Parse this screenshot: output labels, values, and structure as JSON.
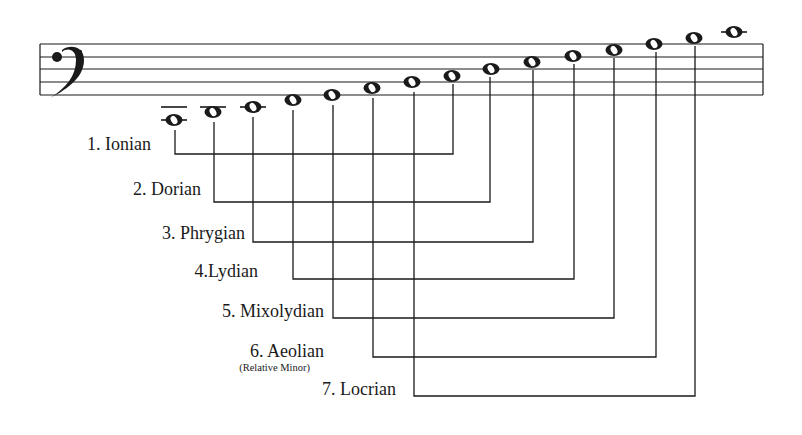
{
  "clef": "bass-clef",
  "colors": {
    "ink": "#1a1a1a",
    "background": "#ffffff"
  },
  "staff": {
    "x_start": 40,
    "x_end": 763,
    "line_y": [
      44,
      57,
      69,
      82,
      95
    ]
  },
  "notes": [
    {
      "index": 1,
      "x": 174,
      "y": 120,
      "ledger": [
        107,
        120
      ]
    },
    {
      "index": 2,
      "x": 213,
      "y": 112,
      "ledger": [
        107
      ]
    },
    {
      "index": 3,
      "x": 253,
      "y": 107,
      "ledger": [
        107
      ]
    },
    {
      "index": 4,
      "x": 293,
      "y": 100,
      "ledger": []
    },
    {
      "index": 5,
      "x": 332,
      "y": 95,
      "ledger": []
    },
    {
      "index": 6,
      "x": 372,
      "y": 88,
      "ledger": []
    },
    {
      "index": 7,
      "x": 412,
      "y": 82,
      "ledger": []
    },
    {
      "index": 8,
      "x": 452,
      "y": 76,
      "ledger": []
    },
    {
      "index": 9,
      "x": 491,
      "y": 69,
      "ledger": []
    },
    {
      "index": 10,
      "x": 532,
      "y": 62,
      "ledger": []
    },
    {
      "index": 11,
      "x": 573,
      "y": 56,
      "ledger": []
    },
    {
      "index": 12,
      "x": 614,
      "y": 50,
      "ledger": []
    },
    {
      "index": 13,
      "x": 654,
      "y": 44,
      "ledger": []
    },
    {
      "index": 14,
      "x": 694,
      "y": 38,
      "ledger": []
    },
    {
      "index": 15,
      "x": 734,
      "y": 32,
      "ledger": [
        32
      ]
    }
  ],
  "modes": [
    {
      "label": "1. Ionian",
      "left_x": 175,
      "right_x": 453,
      "bracket_y": 154,
      "label_right": 151,
      "label_y": 145
    },
    {
      "label": "2. Dorian",
      "left_x": 214,
      "right_x": 490,
      "bracket_y": 202,
      "label_right": 201,
      "label_y": 190
    },
    {
      "label": "3. Phrygian",
      "left_x": 253,
      "right_x": 533,
      "bracket_y": 242,
      "label_right": 245,
      "label_y": 234
    },
    {
      "label": "4.Lydian",
      "left_x": 293,
      "right_x": 574,
      "bracket_y": 279,
      "label_right": 258,
      "label_y": 272
    },
    {
      "label": "5. Mixolydian",
      "left_x": 333,
      "right_x": 614,
      "bracket_y": 318,
      "label_right": 324,
      "label_y": 312,
      "sublabel": null
    },
    {
      "label": "6. Aeolian",
      "left_x": 373,
      "right_x": 656,
      "bracket_y": 357,
      "label_right": 324,
      "label_y": 352,
      "sublabel": "(Relative Minor)"
    },
    {
      "label": "7. Locrian",
      "left_x": 414,
      "right_x": 695,
      "bracket_y": 396,
      "label_right": 396,
      "label_y": 390
    }
  ]
}
